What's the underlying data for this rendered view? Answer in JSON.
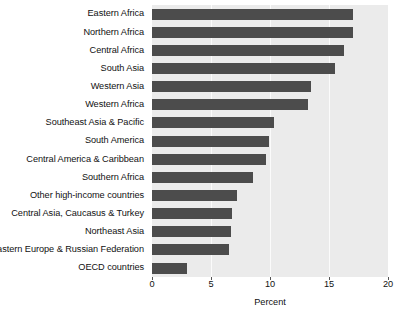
{
  "chart_data": {
    "type": "bar",
    "orientation": "horizontal",
    "title": "",
    "xlabel": "Percent",
    "ylabel": "",
    "xlim": [
      0,
      20
    ],
    "ylim": null,
    "grid": true,
    "gridlines_at": [
      5,
      10,
      15
    ],
    "xticks": [
      0,
      5,
      10,
      15,
      20
    ],
    "xtick_labels": [
      "0",
      "5",
      "10",
      "15",
      "20"
    ],
    "legend": null,
    "categories": [
      "Eastern Africa",
      "Northern Africa",
      "Central Africa",
      "South Asia",
      "Western Asia",
      "Western Africa",
      "Southeast Asia & Pacific",
      "South America",
      "Central America & Caribbean",
      "Southern Africa",
      "Other high-income countries",
      "Central Asia, Caucasus & Turkey",
      "Northeast Asia",
      "Eastern Europe & Russian Federation",
      "OECD countries"
    ],
    "values": [
      17.0,
      17.0,
      16.3,
      15.5,
      13.5,
      13.2,
      10.3,
      9.9,
      9.7,
      8.6,
      7.2,
      6.8,
      6.7,
      6.5,
      3.0
    ],
    "colors": {
      "bar": "#4c4c4c",
      "plot_background": "#ebebeb",
      "figure_background": "#ffffff",
      "gridline": "#fbfbfb",
      "text": "#111111"
    }
  }
}
